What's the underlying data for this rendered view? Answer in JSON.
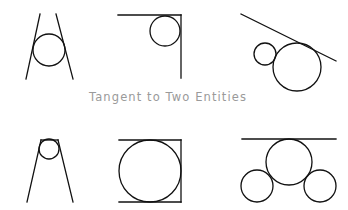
{
  "caption": "Tangent to Two Entities",
  "colors": {
    "stroke": "#111111",
    "caption": "#9a9a9a",
    "background": "#ffffff"
  },
  "figures": [
    {
      "id": "circle-between-two-converging-lines",
      "lines": [
        [
          40,
          14,
          26,
          79
        ],
        [
          56,
          14,
          73,
          79
        ]
      ],
      "circles": [
        [
          49,
          50,
          16
        ]
      ]
    },
    {
      "id": "circle-in-corner",
      "lines": [
        [
          118,
          15,
          181,
          15
        ],
        [
          181,
          15,
          181,
          78
        ]
      ],
      "circles": [
        [
          165,
          31,
          15
        ]
      ]
    },
    {
      "id": "circle-tangent-to-line-and-circle",
      "lines": [
        [
          241,
          14,
          336,
          61
        ]
      ],
      "circles": [
        [
          265,
          54,
          11
        ],
        [
          297,
          67,
          24
        ]
      ]
    },
    {
      "id": "circle-at-apex-of-converging-lines",
      "lines": [
        [
          41,
          140,
          58,
          140
        ],
        [
          41,
          140,
          27,
          202
        ],
        [
          58,
          140,
          73,
          202
        ]
      ],
      "circles": [
        [
          49,
          149,
          10
        ]
      ]
    },
    {
      "id": "circle-between-parallel-lines",
      "lines": [
        [
          119,
          140,
          181,
          140
        ],
        [
          181,
          140,
          181,
          202
        ],
        [
          119,
          202,
          181,
          202
        ]
      ],
      "circles": [
        [
          150,
          171,
          31
        ]
      ]
    },
    {
      "id": "circle-tangent-to-line-and-two-circles",
      "lines": [
        [
          242,
          139,
          336,
          139
        ]
      ],
      "circles": [
        [
          289,
          162,
          23
        ],
        [
          257,
          186,
          16
        ],
        [
          320,
          186,
          16
        ]
      ]
    }
  ]
}
